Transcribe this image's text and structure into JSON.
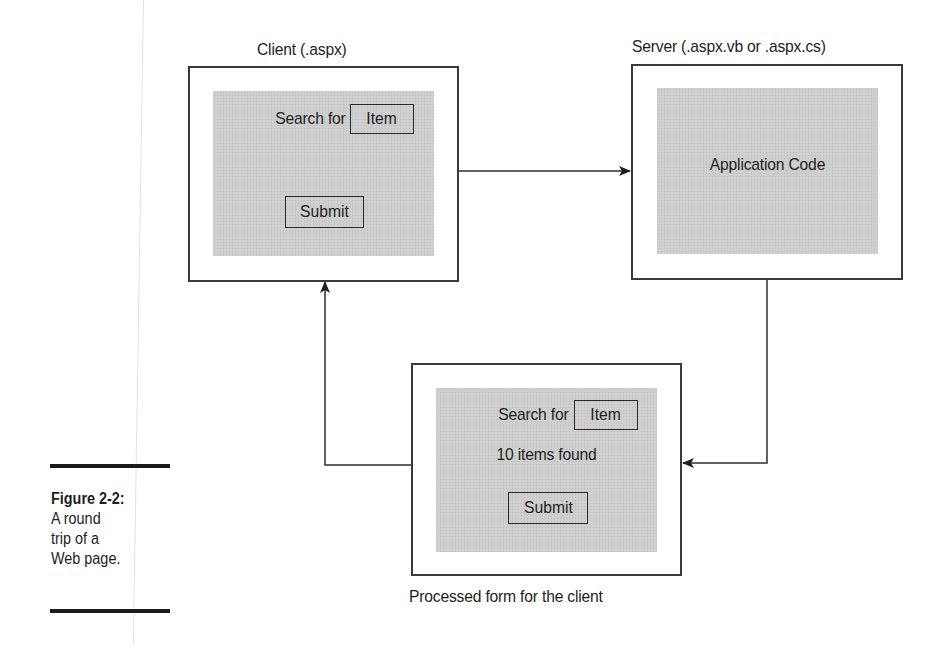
{
  "figure": {
    "number_label": "Figure 2-2:",
    "caption_lines": [
      "A round",
      "trip of a",
      "Web page."
    ]
  },
  "client": {
    "title": "Client (.aspx)",
    "search_label": "Search for",
    "search_field_value": "Item",
    "submit_label": "Submit"
  },
  "server": {
    "title": "Server (.aspx.vb or .aspx.cs)",
    "body_label": "Application Code"
  },
  "processed": {
    "search_label": "Search for",
    "search_field_value": "Item",
    "result_text": "10 items found",
    "submit_label": "Submit",
    "caption": "Processed form for the client"
  },
  "colors": {
    "panel_fill": "#cfcfcf",
    "stroke": "#3a3a3a",
    "background": "#ffffff"
  }
}
